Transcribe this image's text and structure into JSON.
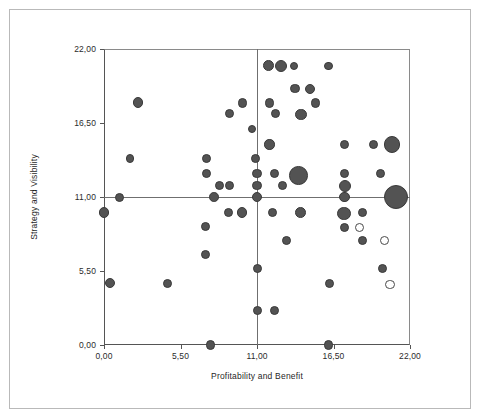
{
  "chart_data": {
    "type": "scatter",
    "title": "",
    "subtitle": "",
    "xlabel": "Profitability and Benefit",
    "ylabel": "Strategy and Visibility",
    "xlim": [
      0,
      22
    ],
    "ylim": [
      0,
      22
    ],
    "xticks": [
      0,
      5.5,
      11,
      16.5,
      22
    ],
    "yticks": [
      0,
      5.5,
      11,
      16.5,
      22
    ],
    "xtick_labels": [
      "0,00",
      "5,50",
      "11,00",
      "16,50",
      "22,00"
    ],
    "ytick_labels": [
      "0,00",
      "5,50",
      "11,00",
      "16,50",
      "22,00"
    ],
    "grid": false,
    "legend": null,
    "decimal_separator": ",",
    "reference_lines": {
      "vertical_x": 11,
      "horizontal_y": 11,
      "color": "#6f6f6f"
    },
    "marker_styles": {
      "filled_fill": "#535353",
      "filled_stroke": "#3a3a3a",
      "hollow_fill": "#ffffff",
      "hollow_stroke": "#4a4a4a"
    },
    "size_encoding": "bubble area (third variable)",
    "points": [
      {
        "x": 11.85,
        "y": 20.75,
        "r": 5.4,
        "style": "filled"
      },
      {
        "x": 12.75,
        "y": 20.75,
        "r": 6.0,
        "style": "filled"
      },
      {
        "x": 13.65,
        "y": 20.75,
        "r": 4.2,
        "style": "filled"
      },
      {
        "x": 16.15,
        "y": 20.75,
        "r": 4.2,
        "style": "filled"
      },
      {
        "x": 2.45,
        "y": 18.0,
        "r": 5.4,
        "style": "filled"
      },
      {
        "x": 9.95,
        "y": 18.0,
        "r": 4.8,
        "style": "filled"
      },
      {
        "x": 13.75,
        "y": 19.05,
        "r": 4.8,
        "style": "filled"
      },
      {
        "x": 14.8,
        "y": 19.05,
        "r": 5.1,
        "style": "filled"
      },
      {
        "x": 15.2,
        "y": 18.0,
        "r": 4.8,
        "style": "filled"
      },
      {
        "x": 11.9,
        "y": 18.0,
        "r": 4.8,
        "style": "filled"
      },
      {
        "x": 9.05,
        "y": 17.2,
        "r": 4.5,
        "style": "filled"
      },
      {
        "x": 12.35,
        "y": 17.2,
        "r": 4.5,
        "style": "filled"
      },
      {
        "x": 14.15,
        "y": 17.15,
        "r": 5.7,
        "style": "filled"
      },
      {
        "x": 10.65,
        "y": 16.05,
        "r": 4.2,
        "style": "filled"
      },
      {
        "x": 11.9,
        "y": 14.9,
        "r": 5.1,
        "style": "filled"
      },
      {
        "x": 1.85,
        "y": 13.85,
        "r": 4.2,
        "style": "filled"
      },
      {
        "x": 7.4,
        "y": 13.85,
        "r": 4.5,
        "style": "filled"
      },
      {
        "x": 10.9,
        "y": 13.85,
        "r": 4.5,
        "style": "filled"
      },
      {
        "x": 17.3,
        "y": 14.9,
        "r": 4.5,
        "style": "filled"
      },
      {
        "x": 19.4,
        "y": 14.9,
        "r": 4.5,
        "style": "filled"
      },
      {
        "x": 20.7,
        "y": 14.9,
        "r": 8.4,
        "style": "filled"
      },
      {
        "x": 7.4,
        "y": 12.75,
        "r": 4.5,
        "style": "filled"
      },
      {
        "x": 11.0,
        "y": 12.75,
        "r": 4.8,
        "style": "filled"
      },
      {
        "x": 12.25,
        "y": 12.75,
        "r": 4.5,
        "style": "filled"
      },
      {
        "x": 17.3,
        "y": 12.75,
        "r": 4.5,
        "style": "filled"
      },
      {
        "x": 19.9,
        "y": 12.75,
        "r": 4.5,
        "style": "filled"
      },
      {
        "x": 14.0,
        "y": 12.6,
        "r": 9.3,
        "style": "filled"
      },
      {
        "x": 8.3,
        "y": 11.85,
        "r": 4.5,
        "style": "filled"
      },
      {
        "x": 9.0,
        "y": 11.85,
        "r": 4.5,
        "style": "filled"
      },
      {
        "x": 11.0,
        "y": 11.85,
        "r": 4.8,
        "style": "filled"
      },
      {
        "x": 12.85,
        "y": 11.85,
        "r": 4.5,
        "style": "filled"
      },
      {
        "x": 17.3,
        "y": 11.85,
        "r": 6.0,
        "style": "filled"
      },
      {
        "x": 1.15,
        "y": 11.0,
        "r": 4.5,
        "style": "filled"
      },
      {
        "x": 7.9,
        "y": 11.0,
        "r": 4.8,
        "style": "filled"
      },
      {
        "x": 11.0,
        "y": 11.0,
        "r": 5.4,
        "style": "filled"
      },
      {
        "x": 17.3,
        "y": 11.0,
        "r": 5.4,
        "style": "filled"
      },
      {
        "x": 21.0,
        "y": 11.0,
        "r": 12.3,
        "style": "filled"
      },
      {
        "x": 0.0,
        "y": 9.85,
        "r": 5.4,
        "style": "filled"
      },
      {
        "x": 8.95,
        "y": 9.85,
        "r": 4.5,
        "style": "filled"
      },
      {
        "x": 9.95,
        "y": 9.85,
        "r": 5.1,
        "style": "filled"
      },
      {
        "x": 12.1,
        "y": 9.85,
        "r": 4.5,
        "style": "filled"
      },
      {
        "x": 14.1,
        "y": 9.85,
        "r": 5.4,
        "style": "filled"
      },
      {
        "x": 17.25,
        "y": 9.8,
        "r": 6.6,
        "style": "filled"
      },
      {
        "x": 18.55,
        "y": 9.85,
        "r": 4.5,
        "style": "filled"
      },
      {
        "x": 7.3,
        "y": 8.8,
        "r": 4.5,
        "style": "filled"
      },
      {
        "x": 17.3,
        "y": 8.7,
        "r": 4.5,
        "style": "filled"
      },
      {
        "x": 18.4,
        "y": 8.7,
        "r": 4.5,
        "style": "hollow"
      },
      {
        "x": 13.15,
        "y": 7.75,
        "r": 4.5,
        "style": "filled"
      },
      {
        "x": 18.55,
        "y": 7.75,
        "r": 4.5,
        "style": "filled"
      },
      {
        "x": 20.15,
        "y": 7.75,
        "r": 4.5,
        "style": "hollow"
      },
      {
        "x": 7.3,
        "y": 6.7,
        "r": 4.5,
        "style": "filled"
      },
      {
        "x": 11.0,
        "y": 5.65,
        "r": 4.5,
        "style": "filled"
      },
      {
        "x": 20.05,
        "y": 5.65,
        "r": 4.5,
        "style": "filled"
      },
      {
        "x": 0.45,
        "y": 4.6,
        "r": 5.1,
        "style": "filled"
      },
      {
        "x": 4.6,
        "y": 4.6,
        "r": 4.5,
        "style": "filled"
      },
      {
        "x": 16.2,
        "y": 4.6,
        "r": 4.5,
        "style": "filled"
      },
      {
        "x": 20.55,
        "y": 4.5,
        "r": 4.8,
        "style": "hollow"
      },
      {
        "x": 11.0,
        "y": 2.55,
        "r": 4.5,
        "style": "filled"
      },
      {
        "x": 12.25,
        "y": 2.55,
        "r": 4.5,
        "style": "filled"
      },
      {
        "x": 7.65,
        "y": 0.0,
        "r": 4.8,
        "style": "filled"
      },
      {
        "x": 16.15,
        "y": 0.0,
        "r": 4.8,
        "style": "filled"
      }
    ]
  }
}
